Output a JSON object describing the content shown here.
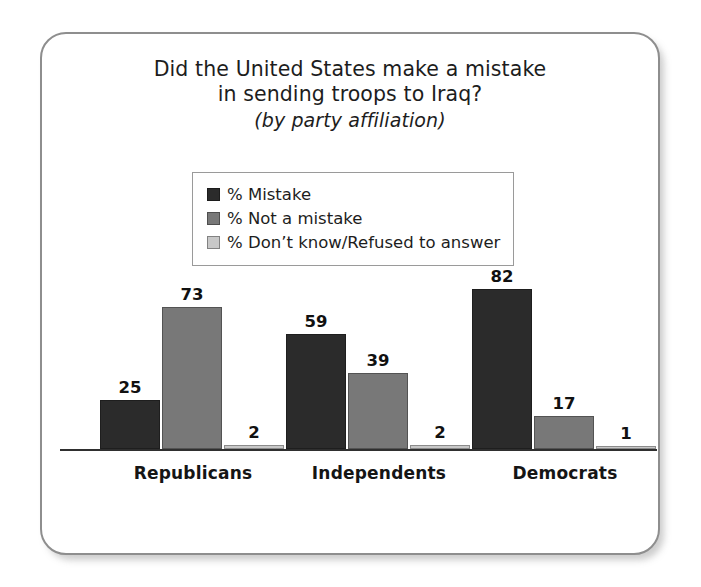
{
  "figure": {
    "border_color": "#8e8e8e",
    "background": "#ffffff"
  },
  "title": {
    "line1": "Did the United States make a mistake",
    "line2": "in sending troops to Iraq?",
    "line3": "(by party affiliation)"
  },
  "legend": {
    "position": "upper-center-inside",
    "items": [
      {
        "label": "% Mistake",
        "color": "#2b2b2b",
        "swatch_name": "legend-swatch-mistake"
      },
      {
        "label": "% Not a mistake",
        "color": "#787878",
        "swatch_name": "legend-swatch-not-a-mistake"
      },
      {
        "label": "% Don’t know/Refused to answer",
        "color": "#c8c8c8",
        "swatch_name": "legend-swatch-dont-know"
      }
    ]
  },
  "axis": {
    "baseline_color": "#2f2f2f",
    "tick_labels": [
      "Republicans",
      "Independents",
      "Democrats"
    ]
  },
  "chart_data": {
    "type": "bar",
    "title": "Did the United States make a mistake in sending troops to Iraq? (by party affiliation)",
    "subtitle": "(by party affiliation)",
    "xlabel": "",
    "ylabel": "",
    "ylim": [
      0,
      100
    ],
    "grid": false,
    "legend_position": "upper center",
    "categories": [
      "Republicans",
      "Independents",
      "Democrats"
    ],
    "series": [
      {
        "name": "% Mistake",
        "color": "#2b2b2b",
        "values": [
          25,
          59,
          82
        ]
      },
      {
        "name": "% Not a mistake",
        "color": "#787878",
        "values": [
          73,
          39,
          17
        ]
      },
      {
        "name": "% Don’t know/Refused to answer",
        "color": "#c8c8c8",
        "values": [
          2,
          2,
          1
        ]
      }
    ],
    "value_labels": [
      [
        "25",
        "73",
        "2"
      ],
      [
        "59",
        "39",
        "2"
      ],
      [
        "82",
        "17",
        "1"
      ]
    ]
  },
  "geometry": {
    "px_per_unit": 1.94,
    "bar_width_px": 60,
    "groups": [
      {
        "left_px": 40,
        "width_px": 186
      },
      {
        "left_px": 226,
        "width_px": 186
      },
      {
        "left_px": 412,
        "width_px": 186
      }
    ]
  }
}
